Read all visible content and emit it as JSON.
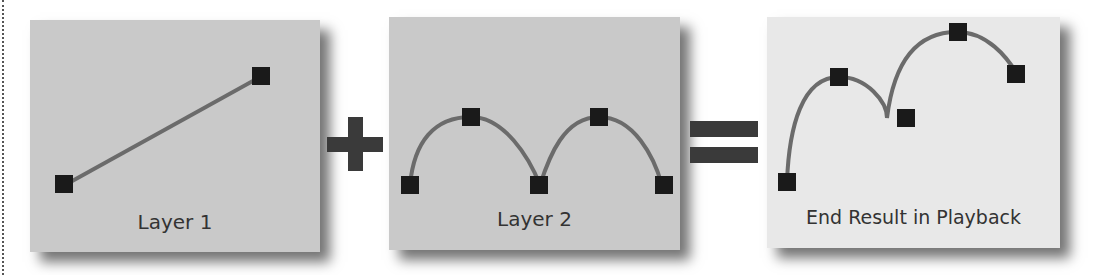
{
  "diagram": {
    "panels": [
      {
        "id": "layer1",
        "label": "Layer 1",
        "background": "#c9c9c9"
      },
      {
        "id": "layer2",
        "label": "Layer 2",
        "background": "#c9c9c9"
      },
      {
        "id": "result",
        "label": "End Result in Playback",
        "background": "#e8e8e8"
      }
    ],
    "operators": [
      "+",
      "="
    ],
    "colors": {
      "curve": "#6b6b6b",
      "keyframe": "#1a1a1a",
      "operator": "#3a3a3a"
    }
  }
}
